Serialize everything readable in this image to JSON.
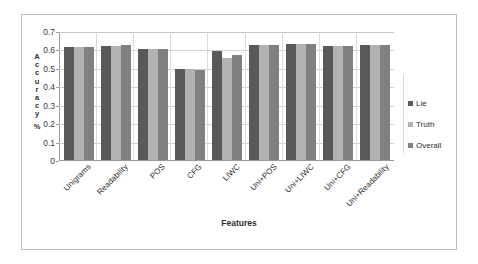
{
  "chart_data": {
    "type": "bar",
    "title": "",
    "xlabel": "Features",
    "ylabel": "Accuracy %",
    "ylim": [
      0,
      0.7
    ],
    "yticks": [
      "0",
      "0.1",
      "0.2",
      "0.3",
      "0.4",
      "0.5",
      "0.6",
      "0.7"
    ],
    "ytick_values": [
      0,
      0.1,
      0.2,
      0.3,
      0.4,
      0.5,
      0.6,
      0.7
    ],
    "grid": true,
    "legend_position": "right",
    "categories": [
      "Unigrams",
      "Readability",
      "POS",
      "CFG",
      "LIWC",
      "Uni+POS",
      "Uni+LIWC",
      "Uni+CFG",
      "Uni+Readability"
    ],
    "series": [
      {
        "name": "Lie",
        "color": "#595959",
        "values": [
          0.615,
          0.62,
          0.605,
          0.495,
          0.59,
          0.625,
          0.63,
          0.62,
          0.625
        ]
      },
      {
        "name": "Truth",
        "color": "#b2b2b2",
        "values": [
          0.615,
          0.62,
          0.605,
          0.495,
          0.555,
          0.625,
          0.63,
          0.62,
          0.625
        ]
      },
      {
        "name": "Overall",
        "color": "#808080",
        "values": [
          0.615,
          0.625,
          0.605,
          0.49,
          0.57,
          0.625,
          0.63,
          0.62,
          0.625
        ]
      }
    ]
  }
}
